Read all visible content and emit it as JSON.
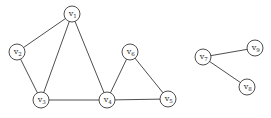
{
  "diagram": {
    "type": "undirected-graph",
    "colors": {
      "background": "#ffffff",
      "stroke": "#3a3a3a",
      "text": "#2a2a2a"
    },
    "node_radius": 8,
    "nodes": [
      {
        "id": "v1",
        "base": "v",
        "sub": "1",
        "x": 72,
        "y": 14
      },
      {
        "id": "v2",
        "base": "v",
        "sub": "2",
        "x": 17,
        "y": 52
      },
      {
        "id": "v3",
        "base": "v",
        "sub": "3",
        "x": 41,
        "y": 100
      },
      {
        "id": "v4",
        "base": "v",
        "sub": "4",
        "x": 107,
        "y": 100
      },
      {
        "id": "v5",
        "base": "v",
        "sub": "5",
        "x": 168,
        "y": 99
      },
      {
        "id": "v6",
        "base": "v",
        "sub": "6",
        "x": 130,
        "y": 52
      },
      {
        "id": "v7",
        "base": "v",
        "sub": "7",
        "x": 203,
        "y": 57
      },
      {
        "id": "v8",
        "base": "v",
        "sub": "8",
        "x": 247,
        "y": 87
      },
      {
        "id": "v9",
        "base": "v",
        "sub": "9",
        "x": 255,
        "y": 48
      }
    ],
    "edges": [
      [
        "v1",
        "v2"
      ],
      [
        "v1",
        "v3"
      ],
      [
        "v1",
        "v4"
      ],
      [
        "v2",
        "v3"
      ],
      [
        "v3",
        "v4"
      ],
      [
        "v4",
        "v6"
      ],
      [
        "v4",
        "v5"
      ],
      [
        "v6",
        "v5"
      ],
      [
        "v7",
        "v9"
      ],
      [
        "v7",
        "v8"
      ]
    ]
  }
}
